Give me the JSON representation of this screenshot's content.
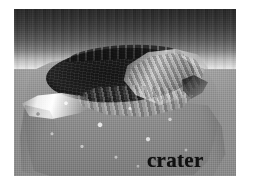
{
  "figure": {
    "kind": "grayscale-micrograph",
    "subject": "crater",
    "colors": {
      "plate_background": "#8d8d8d",
      "substrate_field": "#969696",
      "mound_body": "#949494",
      "cavity_shadow": "#1b1b1b",
      "rim_highlight": "#f2f2f2",
      "label_text": "#141414",
      "page_background": "#ffffff"
    },
    "plate": {
      "left": 14,
      "top": 9,
      "width": 222,
      "height": 167
    }
  },
  "annotations": {
    "crater_label": "crater"
  },
  "regions": {
    "top_band": "specular-band",
    "substrate": "substrate-field",
    "mound": "crater-mound",
    "cavity": "crater-cavity",
    "rim_left": "left-rim-highlight",
    "rim_right": "right-rim-wall",
    "rim_notch": "rim-break-shadow",
    "floor": "crater-floor-ridges",
    "flank_left": "left-flank-shadow",
    "flank_right": "right-flank-shadow",
    "speckle": "surface-granularity"
  }
}
